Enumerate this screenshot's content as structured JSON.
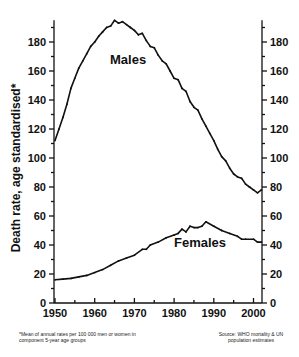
{
  "chart_data": {
    "type": "line",
    "title": "",
    "xlabel": "",
    "ylabel": "Death rate, age standardised*",
    "xlim": [
      1950,
      2002
    ],
    "ylim": [
      0,
      195
    ],
    "x_ticks": [
      1950,
      1960,
      1970,
      1980,
      1990,
      2000
    ],
    "y_ticks": [
      0,
      20,
      40,
      60,
      80,
      100,
      120,
      140,
      160,
      180
    ],
    "y_axis_both_sides": true,
    "grid": false,
    "legend": "inline labels",
    "series": [
      {
        "name": "Males",
        "x": [
          1950,
          1951,
          1952,
          1953,
          1954,
          1955,
          1956,
          1957,
          1958,
          1959,
          1960,
          1961,
          1962,
          1963,
          1964,
          1965,
          1966,
          1967,
          1968,
          1969,
          1970,
          1971,
          1972,
          1973,
          1974,
          1975,
          1976,
          1977,
          1978,
          1979,
          1980,
          1981,
          1982,
          1983,
          1984,
          1985,
          1986,
          1987,
          1988,
          1989,
          1990,
          1991,
          1992,
          1993,
          1994,
          1995,
          1996,
          1997,
          1998,
          1999,
          2000,
          2001,
          2002
        ],
        "values": [
          112,
          120,
          128,
          137,
          148,
          155,
          162,
          167,
          172,
          177,
          180,
          184,
          187,
          190,
          191,
          195,
          193,
          194,
          192,
          190,
          188,
          185,
          186,
          181,
          177,
          176,
          171,
          167,
          165,
          160,
          155,
          154,
          148,
          146,
          139,
          135,
          133,
          127,
          122,
          117,
          112,
          106,
          101,
          98,
          93,
          89,
          87,
          86,
          82,
          80,
          78,
          76,
          78
        ]
      },
      {
        "name": "Females",
        "x": [
          1950,
          1952,
          1954,
          1956,
          1958,
          1960,
          1962,
          1964,
          1966,
          1968,
          1970,
          1972,
          1973,
          1974,
          1976,
          1978,
          1980,
          1981,
          1982,
          1983,
          1984,
          1985,
          1986,
          1987,
          1988,
          1990,
          1992,
          1994,
          1996,
          1997,
          1998,
          2000,
          2001,
          2002
        ],
        "values": [
          16,
          16.5,
          17,
          18,
          19,
          21,
          23,
          26,
          29,
          31,
          33,
          37,
          37,
          40,
          42,
          45,
          47,
          48,
          51,
          49,
          53,
          52,
          52,
          53,
          56,
          53,
          50,
          48,
          46,
          44,
          44,
          44,
          42,
          42
        ]
      }
    ],
    "annotations": [
      "*Mean of annual rates per 100 000 men or women in component 5-year age groups",
      "Source: WHO mortality & UN population estimates"
    ]
  },
  "labels": {
    "ylabel": "Death rate, age standardised*",
    "males": "Males",
    "females": "Females",
    "footnote": "*Mean of annual rates per 100 000 men or women in component 5-year age groups",
    "source": "Source: WHO mortality & UN population estimates"
  }
}
